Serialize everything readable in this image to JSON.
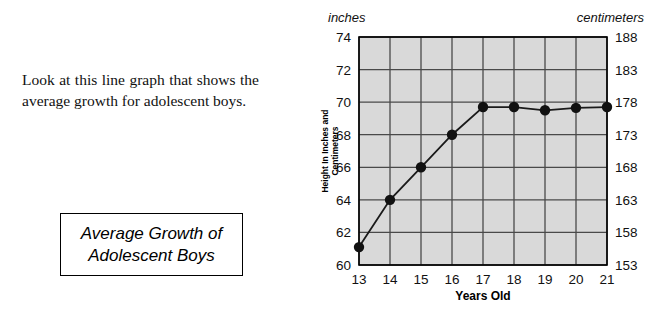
{
  "passage": {
    "text": "Look at this line graph that shows the average growth for adolescent boys."
  },
  "title_box": {
    "label": "Average Growth of\nAdolescent Boys"
  },
  "chart_data": {
    "type": "line",
    "title": "Average Growth of Adolescent Boys",
    "xlabel": "Years Old",
    "ylabel": "Height In Inches and Centimeters",
    "ylabel_line1": "Height In Inches and",
    "ylabel_line2": "Centimeters",
    "left_unit_label": "inches",
    "right_unit_label": "centimeters",
    "categories": [
      13,
      14,
      15,
      16,
      17,
      18,
      19,
      20,
      21
    ],
    "x_tick_labels": [
      "13",
      "14",
      "15",
      "16",
      "17",
      "18",
      "19",
      "20",
      "21"
    ],
    "values": [
      61.1,
      64.0,
      66.0,
      68.0,
      69.7,
      69.7,
      69.5,
      69.65,
      69.7
    ],
    "ylim": [
      60,
      74
    ],
    "y_tick_labels_left": [
      "74",
      "72",
      "70",
      "68",
      "66",
      "64",
      "62",
      "60"
    ],
    "y_ticks_left": [
      74,
      72,
      70,
      68,
      66,
      64,
      62,
      60
    ],
    "y_tick_labels_right": [
      "188",
      "183",
      "178",
      "173",
      "168",
      "163",
      "158",
      "153"
    ],
    "y_ticks_right": [
      188,
      183,
      178,
      173,
      168,
      163,
      158,
      153
    ],
    "grid": true,
    "legend": "none",
    "plot_background": "#d9d9d9",
    "line_color": "#1a1a1a",
    "marker_color": "#111111",
    "grid_color": "#4a4a4a",
    "axis_color": "#000000"
  }
}
